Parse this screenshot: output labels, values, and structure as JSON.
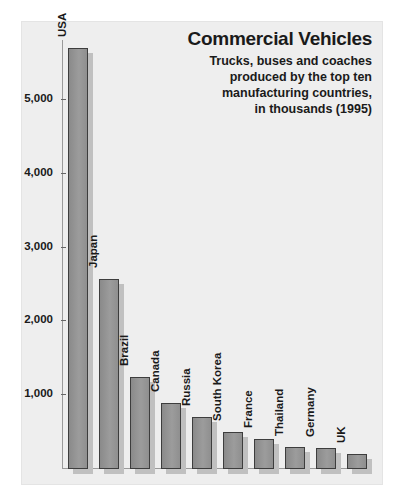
{
  "header": {
    "title": "Commercial Vehicles",
    "subtitle_lines": [
      "Trucks, buses and coaches",
      "produced by the top ten",
      "manufacturing countries,",
      "in thousands (1995)"
    ]
  },
  "colors": {
    "plate_background": "#eeeeee",
    "page_background": "#ffffff",
    "bar_fill": "#8c8c8c",
    "bar_border": "#3d3d3d",
    "bar_shadow": "#c0c0c0",
    "axis": "#9a9a9a",
    "text": "#1a1a1a"
  },
  "chart_data": {
    "type": "bar",
    "title": "Commercial Vehicles",
    "subtitle": "Trucks, buses and coaches produced by the top ten manufacturing countries, in thousands (1995)",
    "xlabel": "",
    "ylabel": "",
    "unit": "thousands",
    "year": 1995,
    "ylim": [
      0,
      5800
    ],
    "yticks": [
      1000,
      2000,
      3000,
      4000,
      5000
    ],
    "ytick_labels": [
      "1,000",
      "2,000",
      "3,000",
      "4,000",
      "5,000"
    ],
    "grid": false,
    "legend": "none",
    "categories": [
      "USA",
      "Japan",
      "Brazil",
      "Canada",
      "Russia",
      "South Korea",
      "France",
      "Thailand",
      "Germany",
      "UK"
    ],
    "values": [
      5700,
      2570,
      1250,
      900,
      700,
      500,
      400,
      300,
      290,
      200
    ]
  }
}
